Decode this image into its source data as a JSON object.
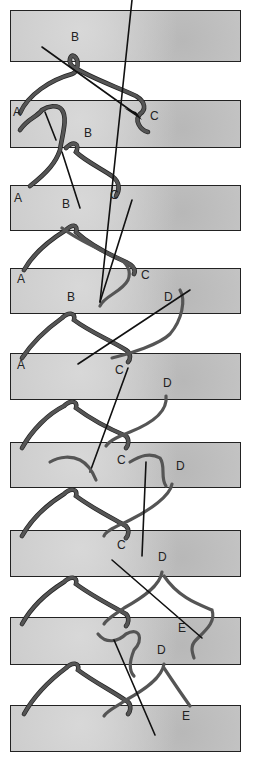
{
  "figure": {
    "thread_color": "#555555",
    "strip_color": "#c9c9c9",
    "outline_color": "#222222"
  },
  "strips": [
    {
      "step": 1,
      "top": 10,
      "height": 52
    },
    {
      "step": 2,
      "top": 100,
      "height": 48
    },
    {
      "step": 3,
      "top": 185,
      "height": 46
    },
    {
      "step": 4,
      "top": 268,
      "height": 46
    },
    {
      "step": 5,
      "top": 353,
      "height": 47
    },
    {
      "step": 6,
      "top": 442,
      "height": 46
    },
    {
      "step": 7,
      "top": 530,
      "height": 47
    },
    {
      "step": 8,
      "top": 617,
      "height": 48
    },
    {
      "step": 9,
      "top": 705,
      "height": 47
    }
  ],
  "labels": [
    {
      "text": "B",
      "x": 71,
      "y": 31
    },
    {
      "text": "A",
      "x": 13,
      "y": 106
    },
    {
      "text": "C",
      "x": 150,
      "y": 110
    },
    {
      "text": "B",
      "x": 84,
      "y": 127
    },
    {
      "text": "A",
      "x": 14,
      "y": 192
    },
    {
      "text": "B",
      "x": 62,
      "y": 198
    },
    {
      "text": "C",
      "x": 110,
      "y": 189
    },
    {
      "text": "A",
      "x": 17,
      "y": 273
    },
    {
      "text": "C",
      "x": 141,
      "y": 269
    },
    {
      "text": "B",
      "x": 67,
      "y": 291
    },
    {
      "text": "D",
      "x": 164,
      "y": 291
    },
    {
      "text": "A",
      "x": 17,
      "y": 359
    },
    {
      "text": "C",
      "x": 115,
      "y": 364
    },
    {
      "text": "D",
      "x": 163,
      "y": 377
    },
    {
      "text": "C",
      "x": 117,
      "y": 454
    },
    {
      "text": "D",
      "x": 176,
      "y": 460
    },
    {
      "text": "C",
      "x": 117,
      "y": 539
    },
    {
      "text": "D",
      "x": 158,
      "y": 551
    },
    {
      "text": "E",
      "x": 178,
      "y": 622
    },
    {
      "text": "D",
      "x": 157,
      "y": 644
    },
    {
      "text": "E",
      "x": 182,
      "y": 710
    }
  ]
}
